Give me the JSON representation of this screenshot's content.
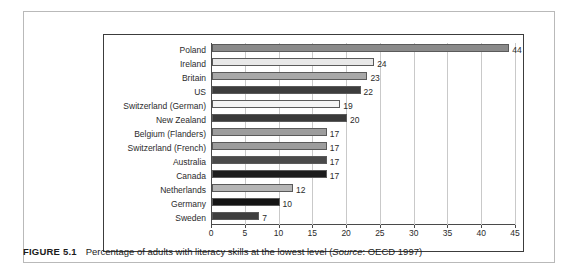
{
  "figure": {
    "tag": "FIGURE 5.1",
    "caption_pre": "Percentage of adults with literacy skills at the lowest level (",
    "caption_source_word": "Source",
    "caption_post": ": OECD 1997)"
  },
  "chart_data": {
    "type": "bar",
    "orientation": "horizontal",
    "title": "",
    "xlabel": "",
    "ylabel": "",
    "xlim": [
      0,
      45
    ],
    "xticks": [
      0,
      5,
      10,
      15,
      20,
      25,
      30,
      35,
      40,
      45
    ],
    "grid": true,
    "legend": "none",
    "categories": [
      "Poland",
      "Ireland",
      "Britain",
      "US",
      "Switzerland (German)",
      "New Zealand",
      "Belgium (Flanders)",
      "Switzerland (French)",
      "Australia",
      "Canada",
      "Netherlands",
      "Germany",
      "Sweden"
    ],
    "values": [
      44,
      24,
      23,
      22,
      19,
      20,
      17,
      17,
      17,
      17,
      12,
      10,
      7
    ],
    "bar_colors": [
      "#8a8a8a",
      "#e8e8e8",
      "#a8a8a8",
      "#3d3d3d",
      "#f4f4f4",
      "#3a3a3a",
      "#9d9d9d",
      "#9d9d9d",
      "#4a4a4a",
      "#1c1c1c",
      "#b5b5b5",
      "#141414",
      "#3f3f3f"
    ]
  }
}
